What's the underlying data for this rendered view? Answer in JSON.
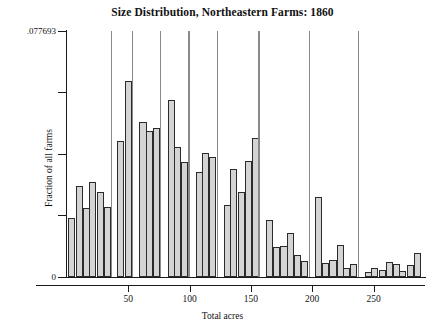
{
  "chart": {
    "title": "Size Distribution, Northeastern Farms: 1860",
    "xlabel": "Total acres",
    "ylabel": "Fraction of all farms"
  },
  "axes": {
    "y_ticks": [
      {
        "value": 0.077693,
        "label": ".077693"
      },
      {
        "value": 0.0582698,
        "label": ""
      },
      {
        "value": 0.0388465,
        "label": ""
      },
      {
        "value": 0.0194233,
        "label": ""
      },
      {
        "value": 0,
        "label": "0"
      }
    ],
    "x_ticks": [
      {
        "value": 50,
        "label": "50"
      },
      {
        "value": 100,
        "label": "100"
      },
      {
        "value": 150,
        "label": "150"
      },
      {
        "value": 200,
        "label": "200"
      },
      {
        "value": 250,
        "label": "250"
      }
    ]
  },
  "chart_data": {
    "type": "bar",
    "title": "Size Distribution, Northeastern Farms: 1860",
    "xlabel": "Total acres",
    "ylabel": "Fraction of all farms",
    "xlim": [
      0,
      292
    ],
    "ylim": [
      0,
      0.077693
    ],
    "grid": false,
    "legend": null,
    "bin_width": 5.8,
    "note": "Histogram of farm sizes; tall narrow spikes occur at round-number acreages (40, 60, 70, 80, 100, 120, 160, 200, 240).",
    "x": [
      4,
      10,
      16,
      21,
      27,
      33,
      39,
      44,
      50,
      56,
      62,
      67,
      73,
      79,
      85,
      90,
      96,
      102,
      108,
      113,
      119,
      125,
      131,
      136,
      142,
      148,
      154,
      159,
      165,
      171,
      177,
      182,
      188,
      194,
      200,
      205,
      211,
      217,
      223,
      228,
      234,
      240,
      246,
      251,
      257,
      263,
      269,
      274,
      280,
      286
    ],
    "values": [
      0.0185,
      0.0288,
      0.0218,
      0.03,
      0.0268,
      0.0222,
      0.0777,
      0.043,
      0.062,
      0.0777,
      0.0488,
      0.046,
      0.047,
      0.0777,
      0.056,
      0.041,
      0.0363,
      0.0777,
      0.0332,
      0.0392,
      0.038,
      0.0777,
      0.0226,
      0.034,
      0.0268,
      0.0366,
      0.044,
      0.0777,
      0.018,
      0.0095,
      0.0098,
      0.014,
      0.0068,
      0.005,
      0.0777,
      0.0253,
      0.0043,
      0.0055,
      0.01,
      0.0028,
      0.004,
      0.0777,
      0.0015,
      0.0028,
      0.0022,
      0.0048,
      0.0042,
      0.002,
      0.0038,
      0.0075
    ],
    "spike_indices": [
      6,
      9,
      13,
      17,
      21,
      27,
      34,
      41
    ]
  }
}
